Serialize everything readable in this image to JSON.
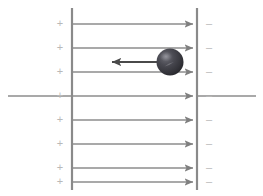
{
  "figure": {
    "width": 263,
    "height": 196,
    "background_color": "#ffffff"
  },
  "colors": {
    "plate": "#8a8a8a",
    "field_line": "#8d8d8d",
    "axis_line": "#8d8d8d",
    "force_arrow": "#555555",
    "sign_text": "#b9b9b9",
    "sphere_dark": "#2f2f33",
    "sphere_mid": "#4a4a50",
    "sphere_highlight": "#7a7a80"
  },
  "plates": {
    "left": {
      "name": "positive-plate",
      "x": 72,
      "y_top": 8,
      "y_bottom": 190,
      "thickness": 2.2,
      "charge_symbol": "+"
    },
    "right": {
      "name": "negative-plate",
      "x": 197,
      "y_top": 8,
      "y_bottom": 190,
      "thickness": 2.2,
      "charge_symbol": "−"
    }
  },
  "charge_signs": {
    "positive": {
      "symbol": "+",
      "x": 60,
      "count": 8,
      "y_positions": [
        24,
        48,
        72,
        96,
        120,
        144,
        168,
        182
      ]
    },
    "negative": {
      "symbol": "–",
      "x": 209,
      "count": 8,
      "y_positions": [
        24,
        48,
        72,
        96,
        120,
        144,
        168,
        182
      ]
    }
  },
  "field_lines": {
    "direction": "right",
    "x_start": 72,
    "x_end": 197,
    "count": 7,
    "y_positions": [
      24,
      48,
      72,
      120,
      144,
      168,
      182
    ]
  },
  "axis_line": {
    "name": "horizontal-axis-line",
    "y": 96,
    "x_left": 8,
    "x_right": 256,
    "has_arrow": true,
    "arrow_x": 192
  },
  "sphere": {
    "name": "charged-sphere",
    "cx": 170,
    "cy": 62,
    "r": 13.5
  },
  "force_arrow": {
    "name": "force-arrow-left",
    "direction": "left",
    "y": 62,
    "x_tail": 166,
    "x_head": 110
  },
  "labels": {
    "positive_side": "+",
    "negative_side": "–"
  }
}
